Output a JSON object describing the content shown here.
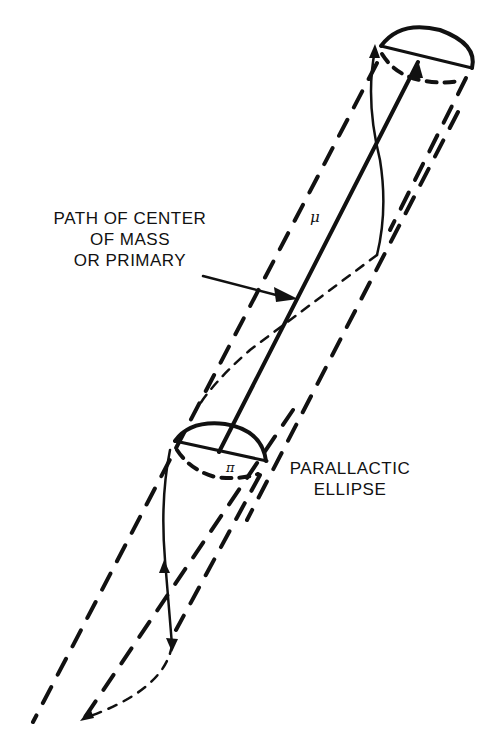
{
  "diagram": {
    "labels": {
      "path_label_line1": "PATH OF CENTER",
      "path_label_line2": "OF MASS",
      "path_label_line3": "OR PRIMARY",
      "ellipse_label_line1": "PARALLACTIC",
      "ellipse_label_line2": "ELLIPSE",
      "mu_symbol": "μ",
      "pi_symbol": "π"
    },
    "colors": {
      "ink": "#111111",
      "background": "#ffffff"
    }
  }
}
